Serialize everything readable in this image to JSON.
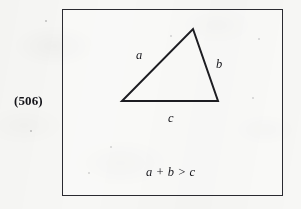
{
  "figure": {
    "item_number": "(506)",
    "box": {
      "border_color": "#2a2a30"
    },
    "background_color": "#f7f7f5",
    "ink_color": "#17171c",
    "triangle": {
      "name": "triangle",
      "vertices": {
        "apex": [
          193,
          29
        ],
        "bottom_left": [
          122,
          101
        ],
        "bottom_right": [
          218,
          101
        ]
      },
      "side_labels": {
        "left_side": "a",
        "right_side": "b",
        "base": "c"
      }
    },
    "inequality": "a + b > c"
  }
}
